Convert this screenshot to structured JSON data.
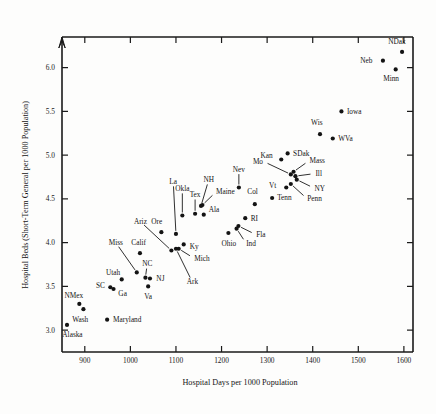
{
  "chart_data": {
    "type": "scatter",
    "title": "",
    "xlabel": "Hospital Days per 1000 Population",
    "ylabel": "Hospital Beds (Short-Term General per 1000 Population)",
    "xlim": [
      850,
      1620
    ],
    "ylim": [
      2.75,
      6.35
    ],
    "grid": false,
    "legend": "none",
    "xticks": [
      900,
      1000,
      1100,
      1200,
      1300,
      1400,
      1500,
      1600
    ],
    "xtick_labels": [
      "900",
      "1000",
      "1100",
      "1200",
      "1300",
      "1400",
      "1500",
      "1600"
    ],
    "yticks": [
      3.0,
      3.5,
      4.0,
      4.5,
      5.0,
      5.5,
      6.0
    ],
    "ytick_labels": [
      "3.0",
      "3.5",
      "4.0",
      "4.5",
      "5.0",
      "5.5",
      "6.0"
    ],
    "point_color": "#141414",
    "axis_color": "#1a1a1a",
    "points": [
      {
        "label": "NDak",
        "x": 1596,
        "y": 6.18,
        "lx": 1585,
        "ly": 6.3,
        "anchor": "middle",
        "leader": false
      },
      {
        "label": "Neb",
        "x": 1554,
        "y": 6.08,
        "lx": 1531,
        "ly": 6.08,
        "anchor": "end",
        "leader": false
      },
      {
        "label": "Minn",
        "x": 1582,
        "y": 5.98,
        "lx": 1572,
        "ly": 5.88,
        "anchor": "middle",
        "leader": false
      },
      {
        "label": "Iowa",
        "x": 1463,
        "y": 5.5,
        "lx": 1475,
        "ly": 5.5,
        "anchor": "start",
        "leader": false
      },
      {
        "label": "Wis",
        "x": 1416,
        "y": 5.24,
        "lx": 1409,
        "ly": 5.37,
        "anchor": "middle",
        "leader": false
      },
      {
        "label": "WVa",
        "x": 1444,
        "y": 5.19,
        "lx": 1456,
        "ly": 5.19,
        "anchor": "start",
        "leader": false
      },
      {
        "label": "SDak",
        "x": 1345,
        "y": 5.02,
        "lx": 1357,
        "ly": 5.02,
        "anchor": "start",
        "leader": false
      },
      {
        "label": "Kan",
        "x": 1331,
        "y": 4.95,
        "lx": 1312,
        "ly": 5.0,
        "anchor": "end",
        "leader": false
      },
      {
        "label": "Mass",
        "x": 1358,
        "y": 4.81,
        "lx": 1393,
        "ly": 4.94,
        "anchor": "start",
        "leader": true
      },
      {
        "label": "Ill",
        "x": 1362,
        "y": 4.76,
        "lx": 1406,
        "ly": 4.79,
        "anchor": "start",
        "leader": true
      },
      {
        "label": "NY",
        "x": 1365,
        "y": 4.72,
        "lx": 1404,
        "ly": 4.62,
        "anchor": "start",
        "leader": true
      },
      {
        "label": "Mo",
        "x": 1352,
        "y": 4.78,
        "lx": 1291,
        "ly": 4.93,
        "anchor": "end",
        "leader": true
      },
      {
        "label": "Vt",
        "x": 1342,
        "y": 4.63,
        "lx": 1320,
        "ly": 4.65,
        "anchor": "end",
        "leader": false
      },
      {
        "label": "Penn",
        "x": 1352,
        "y": 4.67,
        "lx": 1388,
        "ly": 4.5,
        "anchor": "start",
        "leader": true
      },
      {
        "label": "Tenn",
        "x": 1311,
        "y": 4.51,
        "lx": 1322,
        "ly": 4.51,
        "anchor": "start",
        "leader": false
      },
      {
        "label": "Col",
        "x": 1273,
        "y": 4.44,
        "lx": 1268,
        "ly": 4.58,
        "anchor": "middle",
        "leader": false
      },
      {
        "label": "Nev",
        "x": 1238,
        "y": 4.63,
        "lx": 1238,
        "ly": 4.84,
        "anchor": "middle",
        "leader": true
      },
      {
        "label": "RI",
        "x": 1252,
        "y": 4.28,
        "lx": 1264,
        "ly": 4.28,
        "anchor": "start",
        "leader": false
      },
      {
        "label": "Fla",
        "x": 1237,
        "y": 4.19,
        "lx": 1276,
        "ly": 4.09,
        "anchor": "start",
        "leader": true
      },
      {
        "label": "Ind",
        "x": 1233,
        "y": 4.16,
        "lx": 1254,
        "ly": 3.99,
        "anchor": "start",
        "leader": true
      },
      {
        "label": "Ohio",
        "x": 1215,
        "y": 4.11,
        "lx": 1216,
        "ly": 3.99,
        "anchor": "middle",
        "leader": false
      },
      {
        "label": "Maine",
        "x": 1158,
        "y": 4.43,
        "lx": 1188,
        "ly": 4.58,
        "anchor": "start",
        "leader": true
      },
      {
        "label": "NH",
        "x": 1155,
        "y": 4.42,
        "lx": 1172,
        "ly": 4.72,
        "anchor": "middle",
        "leader": true
      },
      {
        "label": "Ala",
        "x": 1161,
        "y": 4.32,
        "lx": 1172,
        "ly": 4.38,
        "anchor": "start",
        "leader": false
      },
      {
        "label": "Tex",
        "x": 1142,
        "y": 4.33,
        "lx": 1142,
        "ly": 4.55,
        "anchor": "middle",
        "leader": true
      },
      {
        "label": "Okla",
        "x": 1114,
        "y": 4.31,
        "lx": 1114,
        "ly": 4.62,
        "anchor": "middle",
        "leader": true
      },
      {
        "label": "La",
        "x": 1100,
        "y": 4.1,
        "lx": 1094,
        "ly": 4.7,
        "anchor": "middle",
        "leader": true
      },
      {
        "label": "Ky",
        "x": 1117,
        "y": 3.98,
        "lx": 1130,
        "ly": 3.95,
        "anchor": "start",
        "leader": false
      },
      {
        "label": "Mich",
        "x": 1106,
        "y": 3.93,
        "lx": 1140,
        "ly": 3.82,
        "anchor": "start",
        "leader": true
      },
      {
        "label": "Ark",
        "x": 1100,
        "y": 3.93,
        "lx": 1136,
        "ly": 3.55,
        "anchor": "middle",
        "leader": true
      },
      {
        "label": "Ore",
        "x": 1068,
        "y": 4.12,
        "lx": 1058,
        "ly": 4.24,
        "anchor": "middle",
        "leader": false
      },
      {
        "label": "Ariz",
        "x": 1090,
        "y": 3.91,
        "lx": 1022,
        "ly": 4.24,
        "anchor": "middle",
        "leader": true
      },
      {
        "label": "Calif",
        "x": 1021,
        "y": 3.88,
        "lx": 1018,
        "ly": 4.0,
        "anchor": "middle",
        "leader": false
      },
      {
        "label": "Miss",
        "x": 1014,
        "y": 3.66,
        "lx": 968,
        "ly": 4.0,
        "anchor": "middle",
        "leader": true
      },
      {
        "label": "NC",
        "x": 1033,
        "y": 3.6,
        "lx": 1037,
        "ly": 3.76,
        "anchor": "middle",
        "leader": true
      },
      {
        "label": "NJ",
        "x": 1043,
        "y": 3.59,
        "lx": 1057,
        "ly": 3.59,
        "anchor": "start",
        "leader": false
      },
      {
        "label": "Utah",
        "x": 981,
        "y": 3.58,
        "lx": 962,
        "ly": 3.66,
        "anchor": "middle",
        "leader": false
      },
      {
        "label": "Va",
        "x": 1039,
        "y": 3.5,
        "lx": 1039,
        "ly": 3.38,
        "anchor": "middle",
        "leader": false
      },
      {
        "label": "Ga",
        "x": 963,
        "y": 3.47,
        "lx": 983,
        "ly": 3.42,
        "anchor": "middle",
        "leader": false
      },
      {
        "label": "SC",
        "x": 956,
        "y": 3.49,
        "lx": 944,
        "ly": 3.51,
        "anchor": "end",
        "leader": false
      },
      {
        "label": "NMex",
        "x": 888,
        "y": 3.3,
        "lx": 876,
        "ly": 3.39,
        "anchor": "middle",
        "leader": false
      },
      {
        "label": "Wash",
        "x": 897,
        "y": 3.24,
        "lx": 890,
        "ly": 3.12,
        "anchor": "middle",
        "leader": false
      },
      {
        "label": "Maryland",
        "x": 949,
        "y": 3.12,
        "lx": 962,
        "ly": 3.12,
        "anchor": "start",
        "leader": false
      },
      {
        "label": "Alaska",
        "x": 861,
        "y": 3.06,
        "lx": 873,
        "ly": 2.95,
        "anchor": "middle",
        "leader": false
      }
    ]
  }
}
